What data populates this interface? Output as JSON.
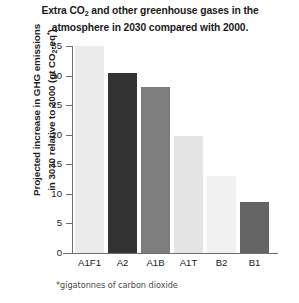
{
  "chart_data": {
    "type": "bar",
    "title": "Extra CO2 and other greenhouse gases in the atmosphere in 2030 compared with 2000.",
    "title_line1_pre": "Extra CO",
    "title_line1_sub": "2",
    "title_line1_post": " and other greenhouse gases in the",
    "title_line2": "atmosphere in 2030 compared with 2000.",
    "xlabel": "",
    "ylabel": "Projected increase in GHG emissions in 3030 relative to 2000 (gt CO2-eq*)",
    "ylabel_line1": "Projected increase in GHG emissions",
    "ylabel_line2_pre": "in 3030 relative to 2000 (gt CO",
    "ylabel_line2_sub": "2",
    "ylabel_line2_mid": "-eq",
    "ylabel_line2_sup": "*",
    "ylabel_line2_post": ")",
    "categories": [
      "A1F1",
      "A2",
      "A1B",
      "A1T",
      "B2",
      "B1"
    ],
    "values": [
      35.0,
      30.4,
      28.0,
      19.8,
      13.1,
      8.7
    ],
    "bar_colors": [
      "#ebebeb",
      "#333333",
      "#7d7d7d",
      "#e4e4e4",
      "#f1f1f1",
      "#646464"
    ],
    "ylim": [
      0,
      35
    ],
    "yticks": [
      35,
      30,
      25,
      20,
      15,
      10,
      5,
      0
    ],
    "ytick_labels": [
      "35",
      "30",
      "25",
      "20",
      "15",
      "10",
      "5",
      "0"
    ],
    "grid": false,
    "legend": false,
    "axis_color": "#6e6e6e",
    "text_color": "#1b1b1b",
    "footnote": "*gigatonnes of carbon dioxide"
  }
}
